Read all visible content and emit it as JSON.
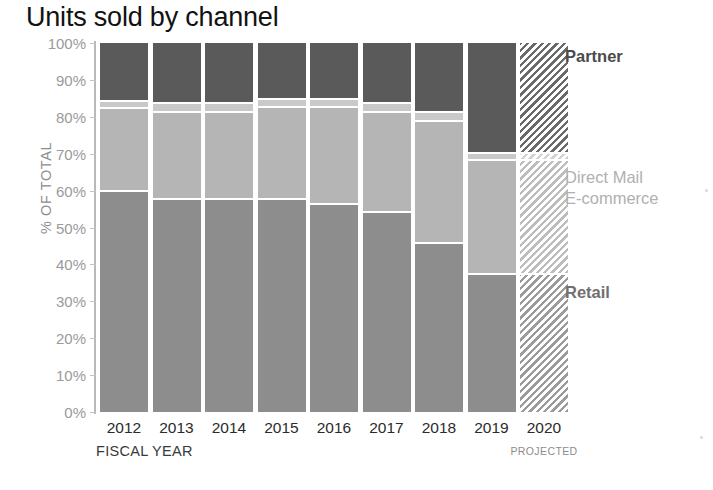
{
  "chart_data": {
    "type": "bar",
    "subtype": "100% stacked bar",
    "title": "Units sold by channel",
    "xlabel": "FISCAL YEAR",
    "ylabel": "% OF TOTAL",
    "categories": [
      "2012",
      "2013",
      "2014",
      "2015",
      "2016",
      "2017",
      "2018",
      "2019",
      "2020"
    ],
    "projected_categories": [
      "2020"
    ],
    "projected_note": "PROJECTED",
    "ylim": [
      0,
      100
    ],
    "yticks": [
      "0%",
      "10%",
      "20%",
      "30%",
      "40%",
      "50%",
      "60%",
      "70%",
      "80%",
      "90%",
      "100%"
    ],
    "ytick_values": [
      0,
      10,
      20,
      30,
      40,
      50,
      60,
      70,
      80,
      90,
      100
    ],
    "grid": false,
    "legend_position": "right",
    "stack_order_bottom_to_top": [
      "Retail",
      "E-commerce",
      "Direct Mail",
      "Partner"
    ],
    "series": [
      {
        "name": "Retail",
        "color": "#8d8d8d",
        "values": [
          59.5,
          57.5,
          57.5,
          57.5,
          56.0,
          54.0,
          45.5,
          37.0,
          37.0
        ]
      },
      {
        "name": "E-commerce",
        "color": "#b5b5b5",
        "values": [
          22.5,
          23.5,
          23.5,
          25.0,
          26.5,
          27.0,
          33.0,
          31.0,
          31.0
        ]
      },
      {
        "name": "Direct Mail",
        "color": "#c9c9c9",
        "values": [
          2.0,
          2.5,
          2.5,
          2.0,
          2.0,
          2.5,
          2.5,
          2.0,
          2.0
        ]
      },
      {
        "name": "Partner",
        "color": "#5a5a5a",
        "values": [
          16.0,
          16.5,
          16.5,
          15.5,
          15.5,
          16.5,
          19.0,
          30.0,
          30.0
        ]
      }
    ],
    "cumulative_tops": {
      "retail": [
        59.5,
        57.5,
        57.5,
        57.5,
        56.0,
        54.0,
        45.5,
        37.0,
        37.0
      ],
      "ecommerce": [
        82.0,
        81.0,
        81.0,
        82.5,
        82.5,
        81.0,
        78.5,
        68.0,
        68.0
      ],
      "directmail": [
        84.0,
        83.5,
        83.5,
        84.5,
        84.5,
        83.5,
        81.0,
        70.0,
        70.0
      ],
      "partner": [
        100,
        100,
        100,
        100,
        100,
        100,
        100,
        100,
        100
      ]
    },
    "legend_labels": {
      "partner": "Partner",
      "direct_mail": "Direct Mail",
      "ecommerce": "E-commerce",
      "retail": "Retail"
    }
  }
}
